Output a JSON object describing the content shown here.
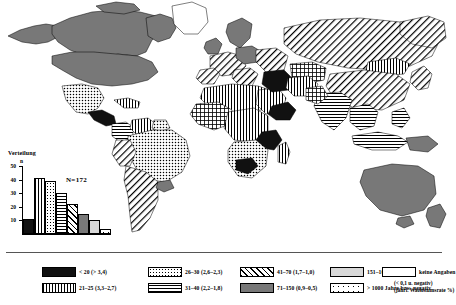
{
  "map": {
    "title": "Weltkarte Bevoelkerungswachstum",
    "projection": "world"
  },
  "inset": {
    "title": "Verteilung",
    "y_axis_label": "n",
    "sample_label": "N=172"
  },
  "legend": {
    "note_line1": "(< 0,1 u. negativ)",
    "note_line2": "(jährl. Wachstumsrate %)",
    "items": [
      {
        "id": "lt20",
        "pattern": "black",
        "label": "< 20  (> 3,4)"
      },
      {
        "id": "21-25",
        "pattern": "vstripe",
        "label": "21–25  (3,3–2,7)"
      },
      {
        "id": "26-30",
        "pattern": "dots",
        "label": "26–30  (2,6–2,3)"
      },
      {
        "id": "31-40",
        "pattern": "hstripe",
        "label": "31–40  (2,2–1,8)"
      },
      {
        "id": "41-70",
        "pattern": "diag",
        "label": "41–70  (1,7–1,0)"
      },
      {
        "id": "71-150",
        "pattern": "dgray",
        "label": "71–150  (0,9–0,5)"
      },
      {
        "id": "151-1000",
        "pattern": "lgray",
        "label": "151–1000  (0,4–0,1)"
      },
      {
        "id": "gt1000",
        "pattern": "sparse",
        "label": "> 1000 Jahre  bzw. negativ"
      },
      {
        "id": "keine",
        "pattern": "none",
        "label": "keine Angaben"
      }
    ]
  },
  "chart_data": {
    "type": "bar",
    "title": "Verteilung",
    "xlabel": "",
    "ylabel": "n",
    "ylim": [
      0,
      50
    ],
    "yticks": [
      10,
      20,
      30,
      40,
      50
    ],
    "grid": false,
    "annotations": [
      "N=172"
    ],
    "categories": [
      "< 20",
      "21–25",
      "26–30",
      "31–40",
      "41–70",
      "71–150",
      "151–1000",
      "> 1000"
    ],
    "values": [
      11,
      41,
      39,
      30,
      22,
      15,
      10,
      4
    ],
    "bar_patterns": [
      "black",
      "vstripe",
      "dots",
      "hstripe",
      "diag",
      "dgray",
      "lgray",
      "sparse"
    ]
  },
  "map_regions": [
    {
      "name": "canada",
      "class": "dgray"
    },
    {
      "name": "united-states",
      "class": "dgray"
    },
    {
      "name": "mexico",
      "class": "dots"
    },
    {
      "name": "central-america",
      "class": "black"
    },
    {
      "name": "brazil",
      "class": "dots"
    },
    {
      "name": "argentina",
      "class": "diag"
    },
    {
      "name": "chile",
      "class": "diag"
    },
    {
      "name": "colombia",
      "class": "hstripe"
    },
    {
      "name": "venezuela",
      "class": "vstripe"
    },
    {
      "name": "north-africa",
      "class": "vstripe"
    },
    {
      "name": "west-africa",
      "class": "dots"
    },
    {
      "name": "central-africa",
      "class": "vstripe"
    },
    {
      "name": "east-africa",
      "class": "black"
    },
    {
      "name": "southern-africa",
      "class": "dots"
    },
    {
      "name": "madagascar",
      "class": "vstripe"
    },
    {
      "name": "europe-west",
      "class": "diag"
    },
    {
      "name": "russia",
      "class": "diag"
    },
    {
      "name": "mongolia",
      "class": "vstripe"
    },
    {
      "name": "china",
      "class": "diag"
    },
    {
      "name": "india",
      "class": "hstripe"
    },
    {
      "name": "middle-east",
      "class": "black"
    },
    {
      "name": "southeast-asia",
      "class": "hstripe"
    },
    {
      "name": "indonesia",
      "class": "hstripe"
    },
    {
      "name": "australia",
      "class": "dgray"
    },
    {
      "name": "new-zealand",
      "class": "dgray"
    },
    {
      "name": "greenland",
      "class": "none"
    }
  ]
}
